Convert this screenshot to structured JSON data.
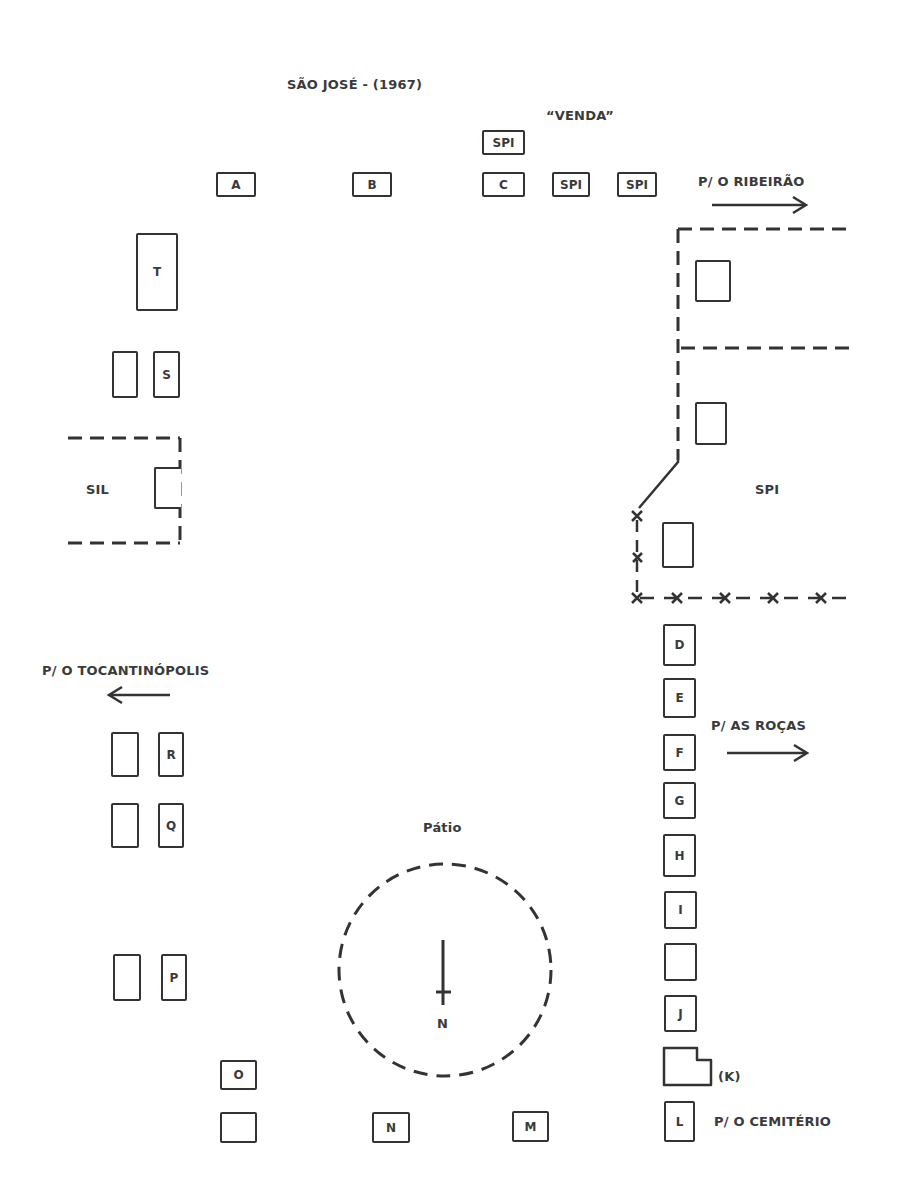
{
  "map": {
    "title": "SÃO JOSÉ - (1967)",
    "venda_label": "“VENDA”",
    "directions": {
      "ribeirao": "P/ O RIBEIRÃO",
      "tocantinopolis": "P/ O TOCANTINÓPOLIS",
      "rocas": "P/ AS ROÇAS",
      "cemiterio": "P/ O CEMITÉRIO"
    },
    "areas": {
      "sil": "SIL",
      "spi": "SPI",
      "patio": "Pátio"
    },
    "north_label": "N",
    "top_row": [
      "A",
      "B",
      "C",
      "SPI",
      "SPI"
    ],
    "venda_house": "SPI",
    "left_column": {
      "t": "T",
      "s": "S",
      "r": "R",
      "q": "Q",
      "p": "P"
    },
    "right_column": [
      "D",
      "E",
      "F",
      "G",
      "H",
      "I",
      "",
      "J"
    ],
    "k_label": "(K)",
    "l_label": "L",
    "bottom_row": {
      "o": "O",
      "blank": "",
      "n": "N",
      "m": "M"
    }
  }
}
